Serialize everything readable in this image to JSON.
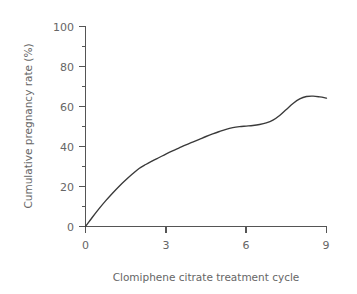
{
  "chart_data": {
    "type": "line",
    "title": "",
    "xlabel": "Clomiphene citrate treatment cycle",
    "ylabel": "Cumulative pregnancy rate (%)",
    "xlim": [
      0,
      9
    ],
    "ylim": [
      0,
      100
    ],
    "grid": false,
    "legend": "none",
    "x_ticks": [
      "0",
      "3",
      "6",
      "9"
    ],
    "x_tick_values": [
      0,
      3,
      6,
      9
    ],
    "y_ticks": [
      "0",
      "20",
      "40",
      "60",
      "80",
      "100"
    ],
    "y_tick_values": [
      0,
      20,
      40,
      60,
      80,
      100
    ],
    "y_minor_tick_values": [
      10,
      30,
      50,
      70,
      90
    ],
    "series": [
      {
        "name": "Cumulative pregnancy rate",
        "color": "#3a3a3a",
        "x": [
          0.0,
          0.25,
          0.5,
          0.75,
          1.0,
          1.25,
          1.5,
          1.75,
          2.0,
          2.25,
          2.5,
          2.75,
          3.0,
          3.25,
          3.5,
          3.75,
          4.0,
          4.25,
          4.5,
          4.75,
          5.0,
          5.25,
          5.5,
          5.75,
          6.0,
          6.25,
          6.5,
          6.75,
          7.0,
          7.25,
          7.5,
          7.75,
          8.0,
          8.25,
          8.5,
          8.75,
          9.0
        ],
        "values": [
          0.0,
          4.5,
          8.8,
          12.8,
          16.5,
          20.0,
          23.2,
          26.2,
          29.0,
          31.0,
          32.8,
          34.5,
          36.2,
          37.8,
          39.3,
          40.8,
          42.2,
          43.6,
          45.0,
          46.3,
          47.5,
          48.6,
          49.4,
          49.9,
          50.2,
          50.5,
          51.0,
          51.8,
          53.2,
          55.5,
          58.5,
          61.5,
          63.8,
          65.0,
          65.2,
          64.8,
          64.2
        ]
      }
    ],
    "annotations": []
  },
  "axis_colors": {
    "axis": "#555555",
    "text": "#666666",
    "curve": "#3a3a3a",
    "background": "#ffffff"
  }
}
